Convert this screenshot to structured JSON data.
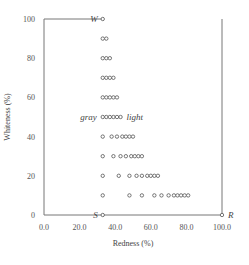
{
  "chart_data": {
    "type": "scatter",
    "title": "",
    "xlabel": "Redness (%)",
    "ylabel": "Whiteness (%)",
    "xlim": [
      0,
      100
    ],
    "ylim": [
      0,
      100
    ],
    "x_ticks": [
      "0.0",
      "20.0",
      "40.0",
      "60.0",
      "80.0",
      "100.0"
    ],
    "y_ticks": [
      "0",
      "20",
      "40",
      "60",
      "80",
      "100"
    ],
    "grid": false,
    "legend": null,
    "annotations": [
      {
        "text": "W",
        "x": 33,
        "y": 100
      },
      {
        "text": "S",
        "x": 33,
        "y": 0
      },
      {
        "text": "R",
        "x": 100,
        "y": 0
      },
      {
        "text": "gray",
        "x": 33,
        "y": 50,
        "position": "left"
      },
      {
        "text": "light",
        "x": 43,
        "y": 50,
        "position": "right"
      }
    ],
    "series": [
      {
        "name": "color samples",
        "points": [
          [
            33,
            100
          ],
          [
            33,
            90
          ],
          [
            35,
            90
          ],
          [
            33,
            80
          ],
          [
            35,
            80
          ],
          [
            37,
            80
          ],
          [
            33,
            70
          ],
          [
            35,
            70
          ],
          [
            37,
            70
          ],
          [
            39,
            70
          ],
          [
            33,
            60
          ],
          [
            35,
            60
          ],
          [
            37,
            60
          ],
          [
            39,
            60
          ],
          [
            41,
            60
          ],
          [
            33,
            50
          ],
          [
            35,
            50
          ],
          [
            37,
            50
          ],
          [
            39,
            50
          ],
          [
            41,
            50
          ],
          [
            43,
            50
          ],
          [
            33,
            40
          ],
          [
            38,
            40
          ],
          [
            41,
            40
          ],
          [
            44,
            40
          ],
          [
            46,
            40
          ],
          [
            48,
            40
          ],
          [
            50,
            40
          ],
          [
            33,
            30
          ],
          [
            39,
            30
          ],
          [
            43,
            30
          ],
          [
            46,
            30
          ],
          [
            49,
            30
          ],
          [
            51,
            30
          ],
          [
            53,
            30
          ],
          [
            55,
            30
          ],
          [
            33,
            20
          ],
          [
            42,
            20
          ],
          [
            48,
            20
          ],
          [
            52,
            20
          ],
          [
            55,
            20
          ],
          [
            58,
            20
          ],
          [
            60,
            20
          ],
          [
            62,
            20
          ],
          [
            64,
            20
          ],
          [
            33,
            10
          ],
          [
            48,
            10
          ],
          [
            55,
            10
          ],
          [
            62,
            10
          ],
          [
            66,
            10
          ],
          [
            70,
            10
          ],
          [
            73,
            10
          ],
          [
            75,
            10
          ],
          [
            77,
            10
          ],
          [
            79,
            10
          ],
          [
            81,
            10
          ],
          [
            33,
            0
          ],
          [
            100,
            0
          ]
        ]
      }
    ]
  }
}
